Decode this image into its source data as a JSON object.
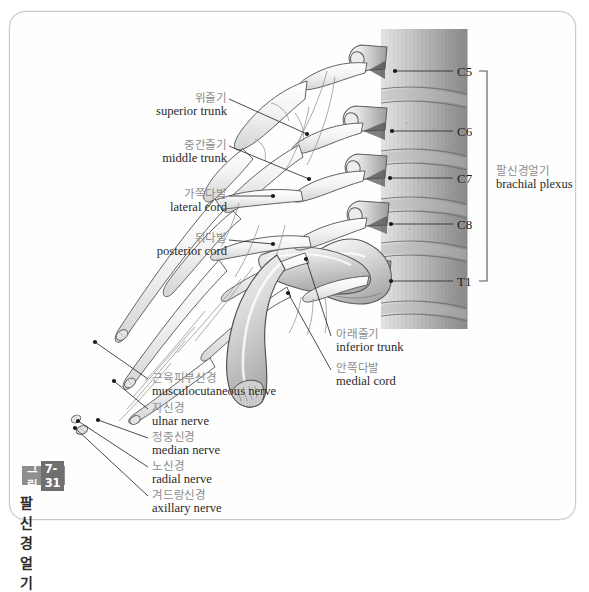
{
  "figure": {
    "badge_label": "그림",
    "badge_number": "7-31",
    "caption_title": "팔신경얼기",
    "accent_color": "#8e8e8e",
    "korean_label_color": "#8d8d8d",
    "english_label_color": "#2b2b2b"
  },
  "labels_left": [
    {
      "name": "superior-trunk",
      "ko": "위줄기",
      "en": "superior trunk",
      "x": 102,
      "y": 82,
      "w": 116,
      "line": {
        "x1": 220,
        "y1": 88,
        "x2": 298,
        "y2": 123
      }
    },
    {
      "name": "middle-trunk",
      "ko": "중간줄기",
      "en": "middle trunk",
      "x": 102,
      "y": 129,
      "w": 116,
      "line": {
        "x1": 220,
        "y1": 135,
        "x2": 300,
        "y2": 168
      }
    },
    {
      "name": "lateral-cord",
      "ko": "가쪽다발",
      "en": "lateral cord",
      "x": 98,
      "y": 178,
      "w": 120,
      "line": {
        "x1": 220,
        "y1": 185,
        "x2": 264,
        "y2": 185
      }
    },
    {
      "name": "posterior-cord",
      "ko": "뒤다발",
      "en": "posterior cord",
      "x": 92,
      "y": 222,
      "w": 126,
      "line": {
        "x1": 220,
        "y1": 229,
        "x2": 264,
        "y2": 233
      }
    }
  ],
  "labels_center": [
    {
      "name": "inferior-trunk",
      "ko": "아래줄기",
      "en": "inferior trunk",
      "x": 327,
      "y": 318,
      "line": {
        "x1": 322,
        "y1": 325,
        "x2": 297,
        "y2": 248
      }
    },
    {
      "name": "medial-cord",
      "ko": "안쪽다발",
      "en": "medial cord",
      "x": 327,
      "y": 352,
      "line": {
        "x1": 322,
        "y1": 359,
        "x2": 279,
        "y2": 282
      }
    }
  ],
  "labels_nerves": [
    {
      "name": "musculocutaneous-nerve",
      "ko": "근육피부신경",
      "en": "musculocutaneous nerve",
      "x": 143,
      "y": 362,
      "line": {
        "x1": 139,
        "y1": 368,
        "x2": 86,
        "y2": 331
      }
    },
    {
      "name": "ulnar-nerve",
      "ko": "자신경",
      "en": "ulnar nerve",
      "x": 143,
      "y": 392,
      "line": {
        "x1": 139,
        "y1": 398,
        "x2": 105,
        "y2": 370
      }
    },
    {
      "name": "median-nerve",
      "ko": "정중신경",
      "en": "median nerve",
      "x": 143,
      "y": 421,
      "line": {
        "x1": 139,
        "y1": 427,
        "x2": 89,
        "y2": 409
      }
    },
    {
      "name": "radial-nerve",
      "ko": "노신경",
      "en": "radial nerve",
      "x": 143,
      "y": 450,
      "line": {
        "x1": 139,
        "y1": 456,
        "x2": 69,
        "y2": 410
      }
    },
    {
      "name": "axillary-nerve",
      "ko": "겨드랑신경",
      "en": "axillary nerve",
      "x": 143,
      "y": 479,
      "line": {
        "x1": 139,
        "y1": 485,
        "x2": 66,
        "y2": 417
      }
    }
  ],
  "vertebra_labels": [
    {
      "name": "c5",
      "text": "C5",
      "x": 448,
      "y": 53,
      "line": {
        "x1": 386,
        "y1": 60,
        "x2": 444,
        "y2": 60
      }
    },
    {
      "name": "c6",
      "text": "C6",
      "x": 448,
      "y": 113,
      "line": {
        "x1": 383,
        "y1": 120,
        "x2": 444,
        "y2": 120
      }
    },
    {
      "name": "c7",
      "text": "C7",
      "x": 448,
      "y": 160,
      "line": {
        "x1": 381,
        "y1": 167,
        "x2": 444,
        "y2": 167
      }
    },
    {
      "name": "c8",
      "text": "C8",
      "x": 448,
      "y": 206,
      "line": {
        "x1": 382,
        "y1": 213,
        "x2": 444,
        "y2": 213
      }
    },
    {
      "name": "t1",
      "text": "T1",
      "x": 448,
      "y": 263,
      "line": {
        "x1": 382,
        "y1": 270,
        "x2": 444,
        "y2": 270
      }
    }
  ],
  "bracket": {
    "name": "brachial-plexus-bracket",
    "ko": "팔신경얼기",
    "en": "brachial plexus",
    "x": 487,
    "y": 155,
    "top": 60,
    "bottom": 270,
    "bar_x": 478,
    "tick": 8
  }
}
